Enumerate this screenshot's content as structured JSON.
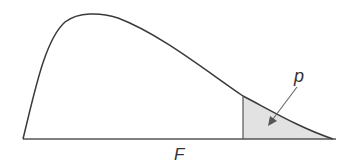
{
  "diagram": {
    "type": "F-distribution density with shaded right tail",
    "x_axis_label": "F",
    "area_label": "p",
    "colors": {
      "curve": "#3a3a3a",
      "shade": "#e2e2e2",
      "axis": "#555555",
      "arrow": "#666666"
    }
  }
}
